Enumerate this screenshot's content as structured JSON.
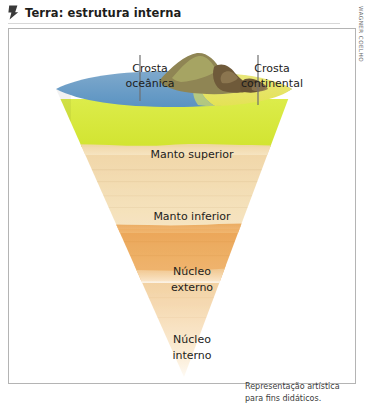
{
  "header": {
    "icon": "flag-bookmark-icon",
    "title": "Terra: estrutura interna"
  },
  "credit": {
    "text": "WAGNER COELHO"
  },
  "callouts": [
    {
      "name": "crosta-oceanica",
      "line1": "Crosta",
      "line2": "oceânica"
    },
    {
      "name": "crosta-continental",
      "line1": "Crosta",
      "line2": "continental"
    }
  ],
  "layers": [
    {
      "name": "manto-superior",
      "line1": "Manto superior",
      "line2": "",
      "color": "#d7e83f"
    },
    {
      "name": "manto-inferior",
      "line1": "Manto inferior",
      "line2": "",
      "color": "#f2d8a8"
    },
    {
      "name": "nucleo-externo",
      "line1": "Núcleo",
      "line2": "externo",
      "color": "#eca85c"
    },
    {
      "name": "nucleo-interno",
      "line1": "Núcleo",
      "line2": "interno",
      "color": "#f6dcb4"
    }
  ],
  "surface": {
    "ocean_color": "#5e97c4",
    "land_color": "#ebe96a",
    "mountain_color": "#8d7a4e"
  },
  "caption": {
    "line1": "Representação artística",
    "line2": "para fins didáticos."
  }
}
